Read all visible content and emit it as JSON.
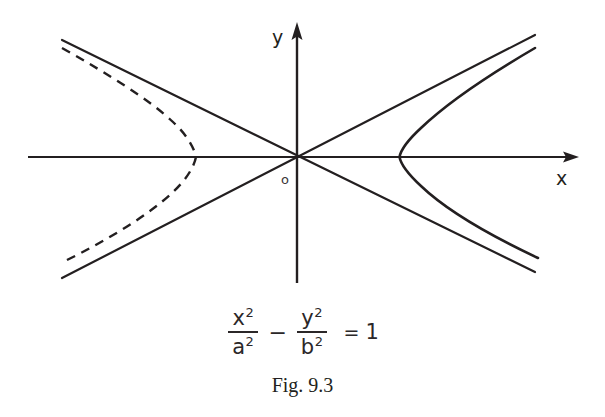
{
  "figure": {
    "caption": "Fig. 9.3",
    "axis_labels": {
      "x": "x",
      "y": "y",
      "origin": "o"
    },
    "equation": {
      "term1": {
        "numerator": "x",
        "numerator_exp": "2",
        "denominator": "a",
        "denominator_exp": "2"
      },
      "operator": "−",
      "term2": {
        "numerator": "y",
        "numerator_exp": "2",
        "denominator": "b",
        "denominator_exp": "2"
      },
      "equals": "=",
      "right_hand_side": "1",
      "plain_text": "x²/a² − y²/b² = 1"
    },
    "colors": {
      "ink": "#231f20",
      "background": "#ffffff"
    },
    "elements": {
      "x_axis": "horizontal-axis-with-right-arrow",
      "y_axis": "vertical-axis-with-up-arrow",
      "asymptote_1": "asymptote-rising-left-to-right",
      "asymptote_2": "asymptote-falling-left-to-right",
      "right_branch": "solid-hyperbola-branch-right",
      "left_branch": "dashed-hyperbola-branch-left"
    }
  }
}
